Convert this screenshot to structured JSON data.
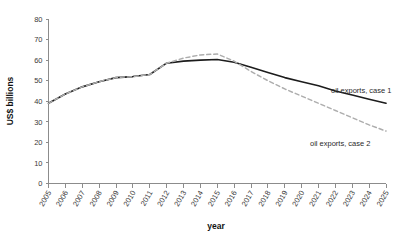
{
  "chart_data": {
    "type": "line",
    "title": "",
    "xlabel": "year",
    "ylabel": "US$ billions",
    "xlim": [
      2005,
      2025
    ],
    "ylim": [
      0,
      80
    ],
    "ytick_step": 10,
    "grid": false,
    "legend_position": "inline-annotations",
    "x": [
      2005,
      2006,
      2007,
      2008,
      2009,
      2010,
      2011,
      2012,
      2013,
      2014,
      2015,
      2016,
      2017,
      2018,
      2019,
      2020,
      2021,
      2022,
      2023,
      2024,
      2025
    ],
    "xticklabels": [
      "2005",
      "2006",
      "2007",
      "2008",
      "2009",
      "2010",
      "2011",
      "2012",
      "2013",
      "2014",
      "2015",
      "2016",
      "2017",
      "2018",
      "2019",
      "2020",
      "2021",
      "2022",
      "2023",
      "2024",
      "2025"
    ],
    "yticklabels": [
      "0",
      "10",
      "20",
      "30",
      "40",
      "50",
      "60",
      "70",
      "80"
    ],
    "yticks": [
      0,
      10,
      20,
      30,
      40,
      50,
      60,
      70,
      80
    ],
    "series": [
      {
        "name": "oil exports, case 1",
        "style": "solid",
        "color": "#1c1c1c",
        "values": [
          39.0,
          43.5,
          47.0,
          49.5,
          51.5,
          52.0,
          53.0,
          58.5,
          59.5,
          60.0,
          60.3,
          59.0,
          56.5,
          54.0,
          51.5,
          49.5,
          47.5,
          45.0,
          43.0,
          41.0,
          39.0
        ]
      },
      {
        "name": "oil exports, case 2",
        "style": "dashed",
        "color": "#adadad",
        "values": [
          39.0,
          43.5,
          47.0,
          49.5,
          51.5,
          52.0,
          53.0,
          58.5,
          61.0,
          62.5,
          63.0,
          59.5,
          54.5,
          50.0,
          46.0,
          42.5,
          39.0,
          35.5,
          32.0,
          28.5,
          25.5
        ]
      }
    ],
    "annotations": [
      {
        "label": "oil exports, case 1",
        "x_px": 331,
        "y_px": 93
      },
      {
        "label": "oil exports, case 2",
        "x_px": 310,
        "y_px": 146
      }
    ]
  },
  "colors": {
    "case1": "#1c1c1c",
    "case2": "#adadad",
    "axis": "#8c8c8c",
    "text": "#2a2a2a",
    "background": "#ffffff"
  }
}
